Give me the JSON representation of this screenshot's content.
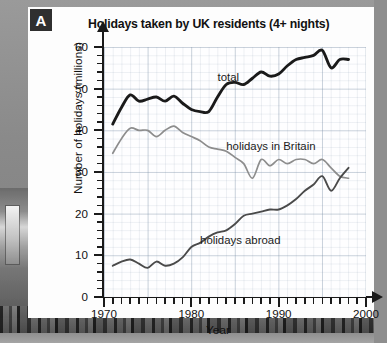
{
  "panel": {
    "badge": "A"
  },
  "chart_data": {
    "type": "line",
    "title": "Holidays taken by UK residents (4+ nights)",
    "xlabel": "Year",
    "ylabel": "Number of holidays (millions)",
    "xlim": [
      1970,
      2000
    ],
    "ylim": [
      0,
      60
    ],
    "xticks": [
      1970,
      1980,
      1990,
      2000
    ],
    "yticks": [
      0,
      10,
      20,
      30,
      40,
      50,
      60
    ],
    "xtick_labels": [
      "1970",
      "1980",
      "1990",
      "2000"
    ],
    "ytick_labels": [
      "0",
      "10",
      "20",
      "30",
      "40",
      "50",
      "60"
    ],
    "x_minor_tick_step": 1,
    "y_minor_tick_step": 2,
    "grid": true,
    "legend": "inline-labels",
    "x": [
      1971,
      1972,
      1973,
      1974,
      1975,
      1976,
      1977,
      1978,
      1979,
      1980,
      1981,
      1982,
      1983,
      1984,
      1985,
      1986,
      1987,
      1988,
      1989,
      1990,
      1991,
      1992,
      1993,
      1994,
      1995,
      1996,
      1997,
      1998
    ],
    "series": [
      {
        "name": "total",
        "label": "total",
        "color": "#1a1a1a",
        "width": 2.9,
        "values": [
          41.5,
          45.5,
          48.5,
          47.0,
          47.5,
          48.0,
          47.0,
          48.2,
          46.5,
          45.0,
          44.5,
          44.5,
          48.0,
          51.0,
          51.5,
          51.0,
          52.5,
          54.0,
          53.0,
          53.5,
          55.5,
          57.0,
          57.5,
          58.0,
          59.2,
          55.0,
          57.0,
          57.0
        ]
      },
      {
        "name": "holidays in Britain",
        "label": "holidays in Britain",
        "color": "#8d8d8d",
        "width": 1.7,
        "values": [
          34.5,
          38.0,
          40.5,
          40.0,
          40.0,
          38.5,
          40.0,
          41.0,
          39.5,
          38.5,
          37.5,
          36.0,
          35.5,
          35.0,
          33.5,
          32.0,
          28.5,
          33.0,
          31.5,
          33.0,
          32.0,
          33.0,
          33.0,
          32.0,
          33.0,
          31.0,
          29.0,
          28.5
        ]
      },
      {
        "name": "holidays abroad",
        "label": "holidays abroad",
        "color": "#4a4a4a",
        "width": 1.9,
        "values": [
          7.5,
          8.5,
          9.0,
          8.0,
          7.0,
          8.5,
          7.5,
          8.0,
          9.5,
          12.0,
          13.0,
          14.5,
          15.5,
          16.0,
          17.5,
          19.5,
          20.0,
          20.5,
          21.0,
          21.0,
          22.0,
          23.5,
          25.5,
          27.0,
          29.0,
          25.5,
          28.5,
          31.0
        ]
      }
    ],
    "annotations": [
      {
        "text": "total",
        "x": 1983,
        "y": 52.5
      },
      {
        "text": "holidays in Britain",
        "x": 1984,
        "y": 36.0
      },
      {
        "text": "holidays abroad",
        "x": 1981,
        "y": 13.5
      }
    ]
  }
}
